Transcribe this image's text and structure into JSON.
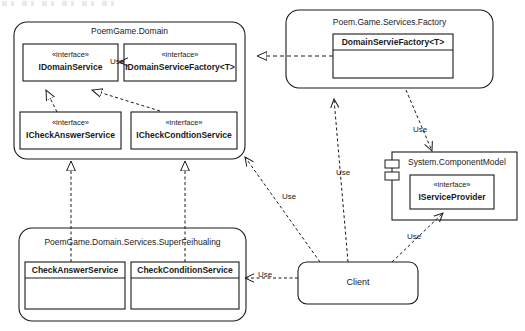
{
  "diagram": {
    "type": "uml-class-diagram",
    "background": "#ffffff",
    "stroke": "#1a1a1a",
    "packages": [
      {
        "id": "poemgame-domain",
        "name": "PoemGame.Domain",
        "shape": "rounded-rect",
        "classes": [
          {
            "id": "idomainservice",
            "stereotype": "«interface»",
            "name": "IDomainService"
          },
          {
            "id": "idomainservicefactory",
            "stereotype": "«interface»",
            "name": "IDomainServiceFactory<T>"
          },
          {
            "id": "icheckanswerservice",
            "stereotype": "«interface»",
            "name": "ICheckAnswerService"
          },
          {
            "id": "icheckcondtionservice",
            "stereotype": "«interface»",
            "name": "ICheckCondtionService"
          }
        ]
      },
      {
        "id": "poem-game-services-factory",
        "name": "Poem.Game.Services.Factory",
        "shape": "rounded-rect",
        "classes": [
          {
            "id": "domainserviefactory",
            "stereotype": "",
            "name": "DomainServieFactory<T>"
          }
        ]
      },
      {
        "id": "system-componentmodel",
        "name": "System.ComponentModel",
        "shape": "component",
        "classes": [
          {
            "id": "iserviceprovider",
            "stereotype": "«interface»",
            "name": "IServiceProvider"
          }
        ]
      },
      {
        "id": "poemgame-domain-services-superfeihualing",
        "name": "PoemGame.Domain.Services.SuperFeihualing",
        "shape": "rounded-rect",
        "classes": [
          {
            "id": "checkanswerservice",
            "stereotype": "",
            "name": "CheckAnswerService"
          },
          {
            "id": "checkconditionservice",
            "stereotype": "",
            "name": "CheckConditionService"
          }
        ]
      }
    ],
    "nodes": [
      {
        "id": "client",
        "name": "Client",
        "shape": "rounded-rect"
      }
    ],
    "edges": [
      {
        "id": "e1",
        "from": "idomainservicefactory",
        "to": "idomainservice",
        "kind": "dependency",
        "label": "Use"
      },
      {
        "id": "e2",
        "from": "icheckanswerservice",
        "to": "idomainservice",
        "kind": "realization",
        "label": ""
      },
      {
        "id": "e3",
        "from": "icheckcondtionservice",
        "to": "idomainservice",
        "kind": "realization",
        "label": ""
      },
      {
        "id": "e4",
        "from": "checkanswerservice",
        "to": "icheckanswerservice",
        "kind": "realization",
        "label": ""
      },
      {
        "id": "e5",
        "from": "checkconditionservice",
        "to": "icheckcondtionservice",
        "kind": "realization",
        "label": ""
      },
      {
        "id": "e6",
        "from": "domainserviefactory",
        "to": "idomainservicefactory",
        "kind": "realization",
        "label": ""
      },
      {
        "id": "e7",
        "from": "client",
        "to": "poem-game-services-factory",
        "kind": "dependency",
        "label": "Use"
      },
      {
        "id": "e8",
        "from": "client",
        "to": "icheckcondtionservice",
        "kind": "dependency",
        "label": "Use"
      },
      {
        "id": "e9",
        "from": "client",
        "to": "iserviceprovider",
        "kind": "dependency",
        "label": "Use"
      },
      {
        "id": "e10",
        "from": "client",
        "to": "checkconditionservice",
        "kind": "dependency",
        "label": "Use"
      },
      {
        "id": "e11",
        "from": "domainserviefactory",
        "to": "system-componentmodel",
        "kind": "dependency",
        "label": "Use"
      }
    ],
    "labels": {
      "use": "Use"
    }
  }
}
